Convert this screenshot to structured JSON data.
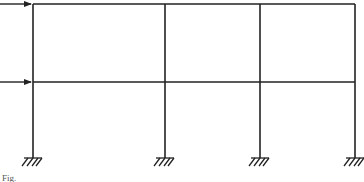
{
  "diagram": {
    "type": "two-story three-bay portal frame",
    "stroke_color": "#222222",
    "columns_x": [
      33,
      165,
      260,
      355
    ],
    "beams_y": [
      4,
      82
    ],
    "base_y": 158,
    "supports": [
      "fixed",
      "fixed",
      "fixed",
      "fixed"
    ],
    "loads": [
      {
        "level": "roof",
        "y": 4,
        "direction": "right",
        "from_x": 0,
        "to_x": 33
      },
      {
        "level": "first floor",
        "y": 82,
        "direction": "right",
        "from_x": 0,
        "to_x": 33
      }
    ],
    "caption": "Fig."
  }
}
